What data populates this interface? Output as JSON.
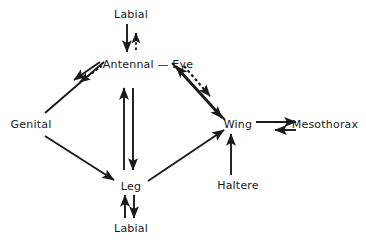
{
  "figure": {
    "type": "directed-graph-diagram",
    "background_color": "#ffffff",
    "line_color": "#1a1a1a",
    "width": 366,
    "height": 243
  },
  "nodes": [
    {
      "id": "labial_top",
      "label": "Labial",
      "x": 131,
      "y": 14
    },
    {
      "id": "antennal_eye",
      "label": "Antennal — Eye",
      "x": 148,
      "y": 64
    },
    {
      "id": "genital",
      "label": "Genital",
      "x": 31,
      "y": 124
    },
    {
      "id": "wing",
      "label": "Wing",
      "x": 238,
      "y": 124
    },
    {
      "id": "mesothorax",
      "label": "Mesothorax",
      "x": 325,
      "y": 124
    },
    {
      "id": "haltere",
      "label": "Haltere",
      "x": 238,
      "y": 185
    },
    {
      "id": "leg",
      "label": "Leg",
      "x": 131,
      "y": 186
    },
    {
      "id": "labial_bottom",
      "label": "Labial",
      "x": 131,
      "y": 228
    }
  ],
  "edges": [
    {
      "from": "labial_top",
      "to": "antennal_eye",
      "style": "solid",
      "direction": "down",
      "label": ""
    },
    {
      "from": "antennal_eye",
      "to": "labial_top",
      "style": "dashed",
      "direction": "up",
      "label": ""
    },
    {
      "from": "antennal_eye",
      "to": "genital",
      "style": "solid",
      "direction": "down-left",
      "label": ""
    },
    {
      "from": "antennal_eye",
      "to": "genital",
      "style": "dashed",
      "direction": "down-left",
      "label": ""
    },
    {
      "from": "genital",
      "to": "antennal_eye",
      "style": "solid",
      "direction": "up-right",
      "label": ""
    },
    {
      "from": "antennal_eye",
      "to": "wing",
      "style": "solid",
      "direction": "down-right",
      "label": ""
    },
    {
      "from": "wing",
      "to": "antennal_eye",
      "style": "solid",
      "direction": "up-left",
      "label": ""
    },
    {
      "from": "antennal_eye",
      "to": "wing",
      "style": "dashed",
      "direction": "down-right",
      "label": ""
    },
    {
      "from": "antennal_eye",
      "to": "leg",
      "style": "solid",
      "direction": "down",
      "label": ""
    },
    {
      "from": "leg",
      "to": "antennal_eye",
      "style": "solid",
      "direction": "up",
      "label": ""
    },
    {
      "from": "genital",
      "to": "leg",
      "style": "solid",
      "direction": "down-right",
      "label": ""
    },
    {
      "from": "leg",
      "to": "wing",
      "style": "solid",
      "direction": "up-right",
      "label": ""
    },
    {
      "from": "haltere",
      "to": "wing",
      "style": "solid",
      "direction": "up",
      "label": ""
    },
    {
      "from": "wing",
      "to": "mesothorax",
      "style": "solid",
      "direction": "right",
      "label": ""
    },
    {
      "from": "mesothorax",
      "to": "wing",
      "style": "solid",
      "direction": "left",
      "label": ""
    },
    {
      "from": "leg",
      "to": "labial_bottom",
      "style": "solid",
      "direction": "down",
      "label": ""
    },
    {
      "from": "labial_bottom",
      "to": "leg",
      "style": "solid",
      "direction": "up",
      "label": ""
    }
  ]
}
